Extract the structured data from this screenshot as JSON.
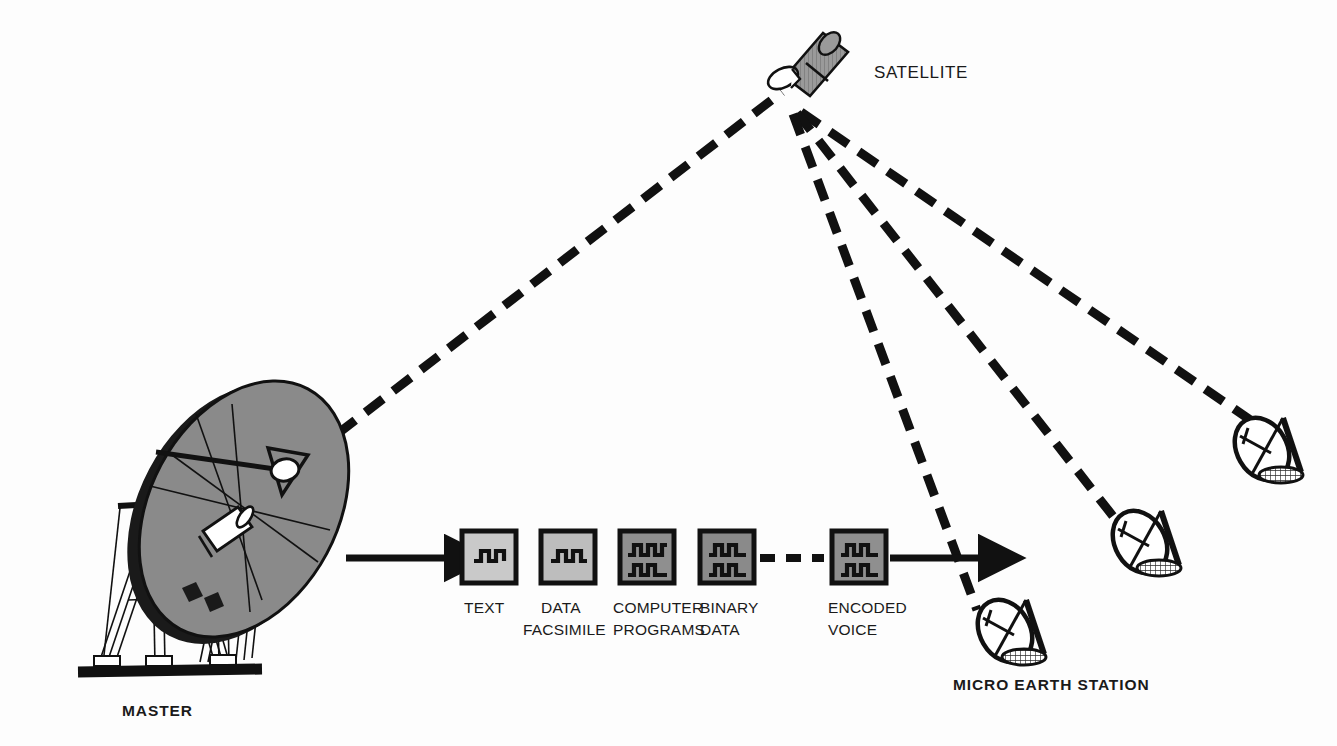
{
  "figure": {
    "background_color": "#ffffff",
    "ink_color": "#111111"
  },
  "labels": {
    "satellite": "SATELLITE",
    "master": "MASTER",
    "micro_earth_station": "MICRO EARTH STATION"
  },
  "signal_blocks": [
    {
      "id": "text",
      "line1": "TEXT",
      "line2": "",
      "fill": "#c9c9c9",
      "wave_rows": 1
    },
    {
      "id": "data-facsimile",
      "line1": "DATA",
      "line2": "FACSIMILE",
      "fill": "#bdbdbd",
      "wave_rows": 1
    },
    {
      "id": "computer-programs",
      "line1": "COMPUTER",
      "line2": "PROGRAMS",
      "fill": "#8f8f8f",
      "wave_rows": 2
    },
    {
      "id": "binary-data",
      "line1": "BINARY",
      "line2": "DATA",
      "fill": "#8a8a8a",
      "wave_rows": 2
    },
    {
      "id": "encoded-voice",
      "line1": "ENCODED",
      "line2": "VOICE",
      "fill": "#8f8f8f",
      "wave_rows": 2
    }
  ],
  "colors": {
    "dish_fill": "#8a8a8a",
    "satellite_body": "#8f8f8f",
    "block_light": "#c9c9c9",
    "block_dark": "#8a8a8a",
    "ground": "#111111"
  },
  "stations": {
    "master_count": 1,
    "micro_count": 3
  }
}
